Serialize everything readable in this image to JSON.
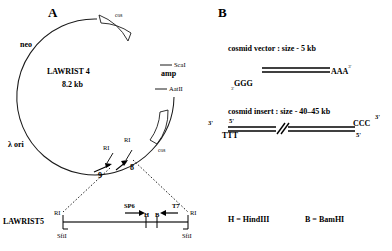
{
  "figure": {
    "panels": [
      {
        "id": "A",
        "letter": "A"
      },
      {
        "id": "B",
        "letter": "B"
      }
    ]
  },
  "panel_a": {
    "letter": "A",
    "plasmid": {
      "name": "LAWRIST 4",
      "size": "8.2 kb"
    },
    "gene_labels": [
      {
        "name": "neo",
        "text": "neo"
      },
      {
        "name": "amp",
        "text": "amp"
      },
      {
        "name": "lambda-ori",
        "text": "λ ori"
      }
    ],
    "cos_sites": [
      {
        "name": "cos-top",
        "text": "cos"
      },
      {
        "name": "cos-right",
        "text": "cos"
      }
    ],
    "restriction_sites": [
      {
        "name": "scai",
        "text": "ScaI"
      },
      {
        "name": "aatii",
        "text": "AatII"
      },
      {
        "name": "ri-left",
        "text": "RI"
      },
      {
        "name": "ri-right",
        "text": "RI"
      }
    ],
    "fragment_numbers": [
      {
        "name": "fragment-9",
        "text": "9"
      },
      {
        "name": "fragment-8",
        "text": "8"
      }
    ],
    "linear_map": {
      "name": "LAWRIST5",
      "left_site": "RI",
      "right_site": "RI",
      "promoters": [
        {
          "name": "sp6",
          "text": "SP6"
        },
        {
          "name": "t7",
          "text": "T7"
        }
      ],
      "inner_sites": [
        {
          "name": "hindiii-site",
          "text": "H"
        },
        {
          "name": "bamhi-site",
          "text": "B"
        }
      ],
      "sfi_sites": [
        {
          "name": "sfii-left",
          "text": "SfiI"
        },
        {
          "name": "sfii-right",
          "text": "SfiI"
        }
      ]
    }
  },
  "panel_b": {
    "letter": "B",
    "vector": {
      "caption": "cosmid vector : size - 5 kb",
      "left_end_prime": "3'",
      "left_end_bases": "GGG",
      "right_end_bases": "AAA",
      "right_end_prime": "3'"
    },
    "insert": {
      "caption": "cosmid insert :  size - 40–45 kb",
      "left_top_prime": "3'",
      "left_inner_prime": "5'",
      "left_bases": "TTT",
      "right_bases": "CCC",
      "right_top_prime": "3'",
      "right_inner_prime": "5'"
    }
  },
  "legend": {
    "entries": [
      {
        "name": "hindiii-legend",
        "text": "H = HindIII"
      },
      {
        "name": "bamhi-legend",
        "text": "B = BamHI"
      }
    ]
  }
}
